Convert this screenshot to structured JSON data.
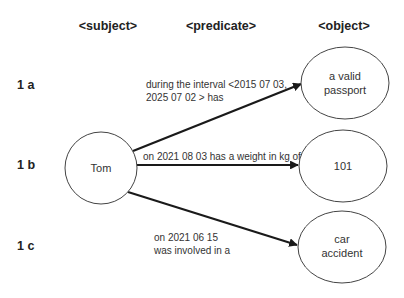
{
  "headers": {
    "subject": "<subject>",
    "predicate": "<predicate>",
    "object": "<object>"
  },
  "rows": [
    {
      "id": "1 a"
    },
    {
      "id": "1 b"
    },
    {
      "id": "1 c"
    }
  ],
  "subject_node": {
    "label": "Tom"
  },
  "edges": [
    {
      "line1": "during the interval <2015 07 03,",
      "line2": "2025 07 02 > has"
    },
    {
      "line1": "on 2021 08 03 has a weight in kg of"
    },
    {
      "line1": "on 2021 06 15",
      "line2": "was involved  in a"
    }
  ],
  "object_nodes": [
    {
      "line1": "a valid",
      "line2": "passport"
    },
    {
      "line1": "101"
    },
    {
      "line1": "car",
      "line2": "accident"
    }
  ],
  "colors": {
    "stroke": "#1a1a1a",
    "node_border": "#444444",
    "background": "#ffffff"
  }
}
